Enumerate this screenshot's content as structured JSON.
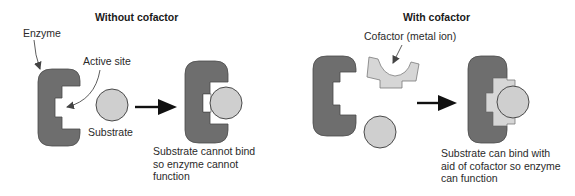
{
  "colors": {
    "enzyme": "#6e6e6e",
    "enzyme_stroke": "#4a4a4a",
    "substrate": "#cfcfcf",
    "substrate_stroke": "#4a4a4a",
    "cofactor": "#d6d6d6",
    "cofactor_stroke": "#7a7a7a",
    "arrow": "#111111",
    "background": "#ffffff"
  },
  "panels": [
    {
      "id": "without-cofactor",
      "heading": "Without cofactor",
      "labels": {
        "enzyme": "Enzyme",
        "active_site": "Active site",
        "substrate": "Substrate"
      },
      "caption_lines": [
        "Substrate cannot bind",
        "so enzyme cannot",
        "function"
      ]
    },
    {
      "id": "with-cofactor",
      "heading": "With cofactor",
      "labels": {
        "cofactor": "Cofactor (metal ion)"
      },
      "caption_lines": [
        "Substrate can bind with",
        "aid of cofactor so enzyme",
        "can function"
      ]
    }
  ]
}
